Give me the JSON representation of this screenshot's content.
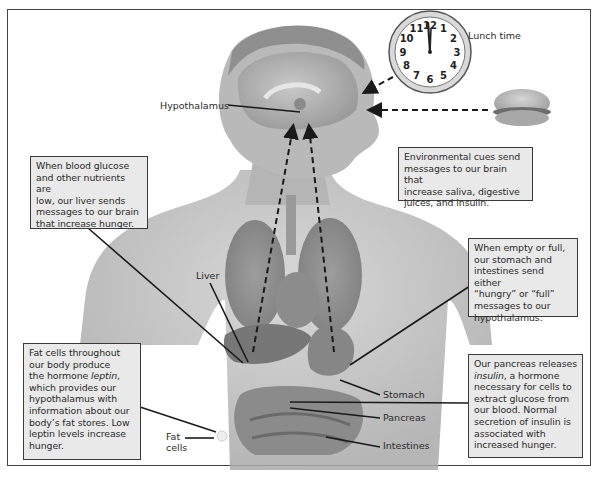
{
  "figure": {
    "type": "anatomical-diagram"
  },
  "labels": {
    "hypothalamus": "Hypothalamus",
    "lunch_time": "Lunch time",
    "liver": "Liver",
    "stomach": "Stomach",
    "pancreas": "Pancreas",
    "intestines": "Intestines",
    "fat_cells_line1": "Fat",
    "fat_cells_line2": "cells"
  },
  "callouts": {
    "liver": {
      "lines": [
        "When blood glucose",
        "and other nutrients are",
        "low, our liver sends",
        "messages to our brain",
        "that increase hunger."
      ]
    },
    "environmental": {
      "lines": [
        "Environmental cues send",
        "messages to our brain that",
        "increase saliva, digestive",
        "juices, and insulin."
      ]
    },
    "stomach": {
      "lines": [
        "When empty or full,",
        "our stomach and",
        "intestines send either",
        "“hungry” or “full”",
        "messages to our",
        "hypothalamus."
      ]
    },
    "fat_cells": {
      "line1": "Fat cells throughout",
      "line2": "our body produce",
      "line3_prefix": "the hormone ",
      "line3_em": "leptin",
      "line3_suffix": ",",
      "line4": "which provides our",
      "line5": "hypothalamus with",
      "line6": "information about our",
      "line7": "body’s fat stores. Low",
      "line8": "leptin levels increase",
      "line9": "hunger."
    },
    "pancreas": {
      "line1": "Our pancreas releases",
      "line2_em": "insulin",
      "line2_suffix": ", a hormone",
      "line3": "necessary for cells to",
      "line4": "extract glucose from",
      "line5": "our blood. Normal",
      "line6": "secretion of insulin is",
      "line7": "associated with",
      "line8": "increased hunger."
    }
  },
  "clock": {
    "numbers": [
      "12",
      "1",
      "2",
      "3",
      "4",
      "5",
      "6",
      "7",
      "8",
      "9",
      "10",
      "11"
    ],
    "time_shown": "12:00"
  },
  "colors": {
    "frame": "#444444",
    "callout_bg": "#e9e9e9",
    "callout_border": "#3a3a3a",
    "body_gray": "#b8b8b8",
    "arrow": "#1a1a1a"
  }
}
